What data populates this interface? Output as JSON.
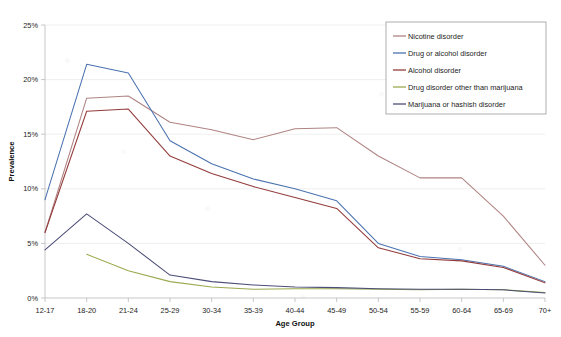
{
  "chart_data": {
    "type": "line",
    "title": "",
    "xlabel": "Age Group",
    "ylabel": "Prevalence",
    "categories": [
      "12-17",
      "18-20",
      "21-24",
      "25-29",
      "30-34",
      "35-39",
      "40-44",
      "45-49",
      "50-54",
      "55-59",
      "60-64",
      "65-69",
      "70+"
    ],
    "ylim": [
      0,
      25
    ],
    "ytick_labels": [
      "0%",
      "5%",
      "10%",
      "15%",
      "20%",
      "25%"
    ],
    "ytick_values": [
      0,
      5,
      10,
      15,
      20,
      25
    ],
    "grid": true,
    "legend_position": "top-right",
    "series": [
      {
        "name": "Nicotine disorder",
        "color": "#b08383",
        "values": [
          6.0,
          18.3,
          18.5,
          16.1,
          15.4,
          14.5,
          15.5,
          15.6,
          13.0,
          11.0,
          11.0,
          7.5,
          3.0
        ]
      },
      {
        "name": "Drug or alcohol disorder",
        "color": "#4a72b0",
        "values": [
          9.0,
          21.4,
          20.6,
          14.4,
          12.3,
          10.9,
          10.0,
          8.9,
          5.0,
          3.8,
          3.5,
          2.9,
          1.5
        ]
      },
      {
        "name": "Alcohol disorder",
        "color": "#933b3b",
        "values": [
          6.0,
          17.1,
          17.3,
          13.0,
          11.4,
          10.2,
          9.2,
          8.2,
          4.6,
          3.6,
          3.4,
          2.8,
          1.4
        ]
      },
      {
        "name": "Drug disorder other than marijuana",
        "color": "#9aaa4e",
        "values": [
          null,
          4.0,
          2.5,
          1.5,
          1.0,
          0.8,
          0.85,
          0.85,
          0.8,
          0.75,
          0.8,
          0.75,
          0.5
        ]
      },
      {
        "name": "Marijuana or hashish disorder",
        "color": "#4b4e77",
        "values": [
          4.4,
          7.7,
          5.0,
          2.1,
          1.5,
          1.2,
          1.0,
          0.95,
          0.85,
          0.8,
          0.8,
          0.75,
          0.45
        ]
      }
    ]
  },
  "axes": {
    "x_title": "Age Group",
    "y_title": "Prevalence"
  }
}
